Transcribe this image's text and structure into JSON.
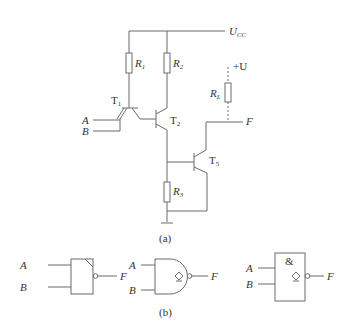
{
  "diagram": {
    "part_a_caption": "(a)",
    "part_b_caption": "(b)",
    "supply": {
      "label": "U",
      "sub": "CC"
    },
    "ext_supply": "+U",
    "resistors": [
      {
        "label": "R",
        "sub": "1"
      },
      {
        "label": "R",
        "sub": "2"
      },
      {
        "label": "R",
        "sub": "3"
      },
      {
        "label": "R",
        "sub": "L"
      }
    ],
    "transistors": [
      {
        "label": "T",
        "sub": "1"
      },
      {
        "label": "T",
        "sub": "2"
      },
      {
        "label": "T",
        "sub": "5"
      }
    ],
    "inputs": [
      "A",
      "B"
    ],
    "output": "F",
    "gates": [
      {
        "style": "block-with-corner",
        "inputs": [
          "A",
          "B"
        ],
        "output": "F"
      },
      {
        "style": "distinctive-shape",
        "inputs": [
          "A",
          "B"
        ],
        "output": "F",
        "symbol": "◇"
      },
      {
        "style": "IEC-rectangular",
        "inputs": [
          "A",
          "B"
        ],
        "output": "F",
        "function": "&",
        "symbol": "◇"
      }
    ]
  }
}
